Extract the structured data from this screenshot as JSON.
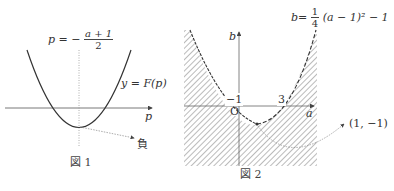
{
  "figure1": {
    "caption": "図 1",
    "axis_label": "p",
    "vertex_line_label": {
      "lhs": "p",
      "eq": "= −",
      "numerator": "a + 1",
      "denominator": "2"
    },
    "curve_label": "y = F(p)",
    "vertex_annotation": "負"
  },
  "figure2": {
    "caption": "図 2",
    "x_axis_label": "a",
    "y_axis_label": "b",
    "origin_label": "O",
    "tick_left": "−1",
    "tick_right": "3",
    "curve_label": {
      "lhs": "b",
      "eq": "=",
      "numerator": "1",
      "denominator": "4",
      "rhs": "(a − 1)² − 1"
    },
    "vertex_annotation": "(1, −1)"
  },
  "colors": {
    "line": "#333333",
    "hatch": "#555555",
    "dotted": "#888888"
  }
}
